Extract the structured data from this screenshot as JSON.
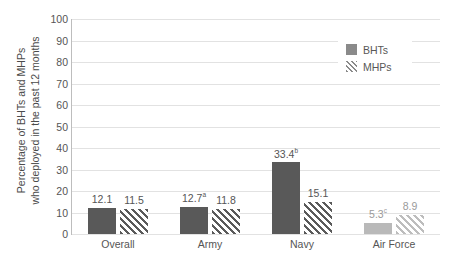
{
  "chart_data": {
    "type": "bar",
    "title": "",
    "xlabel": "",
    "ylabel": "Percentage of BHTs and MHPs who deployed in the past 12 months",
    "ylabel_lines": [
      "Percentage of BHTs and MHPs",
      "who deployed in the past 12 months"
    ],
    "ylim": [
      0,
      100
    ],
    "yticks": [
      0,
      10,
      20,
      30,
      40,
      50,
      60,
      70,
      80,
      90,
      100
    ],
    "ytick_labels": [
      "0",
      "10",
      "20",
      "30",
      "40",
      "50",
      "60",
      "70",
      "80",
      "90",
      "100"
    ],
    "grid": true,
    "grid_axis": "y",
    "legend_position": "upper right",
    "categories": [
      "Overall",
      "Army",
      "Navy",
      "Air Force"
    ],
    "series": [
      {
        "name": "BHTs",
        "style": "solid",
        "color": "#595959",
        "values": [
          12.1,
          12.7,
          33.4,
          5.3
        ],
        "labels": [
          "12.1",
          "12.7",
          "33.4",
          "5.3"
        ],
        "label_superscripts": [
          "",
          "a",
          "b",
          "c"
        ]
      },
      {
        "name": "MHPs",
        "style": "hatch",
        "color": "#5a5a5a",
        "values": [
          11.5,
          11.8,
          15.1,
          8.9
        ],
        "labels": [
          "11.5",
          "11.8",
          "15.1",
          "8.9"
        ],
        "label_superscripts": [
          "",
          "",
          "",
          ""
        ]
      }
    ],
    "faded_categories": [
      "Air Force"
    ],
    "colors": {
      "bar_dark": "#595959",
      "bar_faded": "#b9b9b9",
      "gridline": "#e2e2e2",
      "axis": "#bdbdbd",
      "text": "#555555",
      "legend_swatch": "#8a8a8a",
      "background": "#ffffff"
    }
  },
  "legend": {
    "items": [
      {
        "label": "BHTs",
        "style": "solid"
      },
      {
        "label": "MHPs",
        "style": "hatch"
      }
    ]
  }
}
